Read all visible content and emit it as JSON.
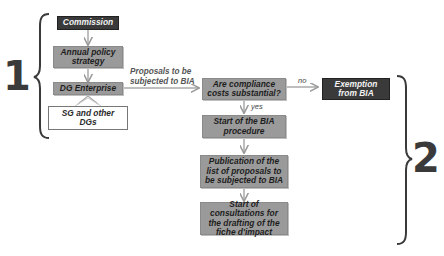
{
  "diagram": {
    "stages": [
      {
        "number": "1"
      },
      {
        "number": "2"
      }
    ],
    "nodes": {
      "commission": "Commission",
      "annual_policy": "Annual policy strategy",
      "dg_enterprise": "DG Enterprise",
      "sg_other": "SG and other DGs",
      "compliance_question": "Are compliance costs substantial?",
      "exemption": "Exemption from BIA",
      "start_bia": "Start of the BIA procedure",
      "publication": "Publication of the list of proposals to be subjected to BIA",
      "consultations": "Start of consultations for the drafting of the fiche d'impact"
    },
    "edge_labels": {
      "proposals": "Proposals to be subjected to BIA",
      "no": "no",
      "yes": "yes"
    },
    "colors": {
      "dark_box": "#3a3a3a",
      "grey_box": "#9a9a9a",
      "white_box": "#ffffff",
      "text_dark": "#1e1e1e",
      "brace": "#3a3a3a"
    }
  }
}
